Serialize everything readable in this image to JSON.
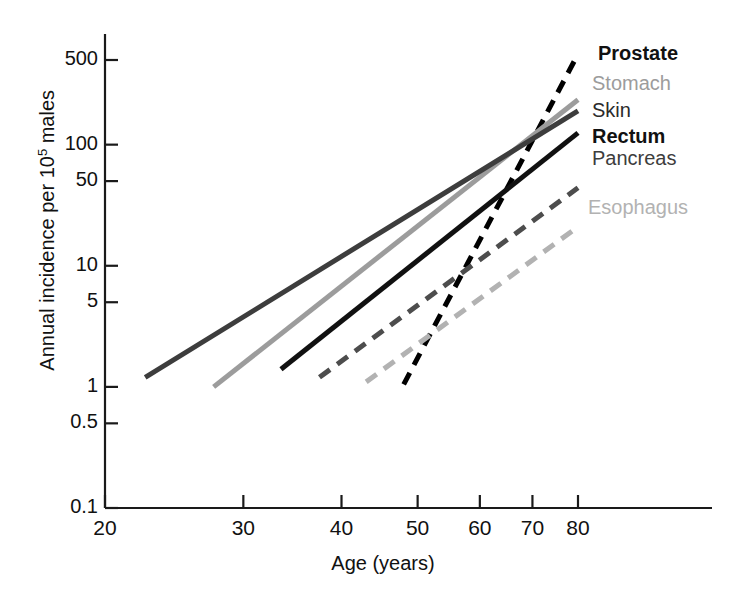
{
  "chart_data": {
    "type": "line",
    "title": "",
    "xlabel": "Age (years)",
    "ylabel": "Annual incidence per 10⁵ males",
    "ylabel_base": "Annual incidence per 10",
    "ylabel_exp": "5",
    "ylabel_tail": " males",
    "x_scale": "log",
    "y_scale": "log",
    "xlim": [
      20,
      90
    ],
    "ylim": [
      0.1,
      800
    ],
    "xticks": [
      20,
      30,
      40,
      50,
      60,
      70,
      80
    ],
    "xtick_labels": [
      "20",
      "30",
      "40",
      "50",
      "60",
      "70",
      "80"
    ],
    "yticks": [
      0.1,
      0.5,
      1,
      5,
      10,
      50,
      100,
      500
    ],
    "ytick_labels": [
      "0.1",
      "0.5",
      "1",
      "5",
      "10",
      "50",
      "100",
      "500"
    ],
    "grid": false,
    "legend_position": "right-inline-labels",
    "series": [
      {
        "name": "Prostate",
        "color": "#000000",
        "style": "dashed",
        "width": 5,
        "x": [
          48,
          80
        ],
        "y": [
          1.05,
          560
        ]
      },
      {
        "name": "Stomach",
        "color": "#9c9c9c",
        "style": "solid",
        "width": 5,
        "x": [
          27.5,
          80
        ],
        "y": [
          1.0,
          235
        ]
      },
      {
        "name": "Skin",
        "color": "#3d3d3d",
        "style": "solid",
        "width": 5,
        "x": [
          22.5,
          80
        ],
        "y": [
          1.2,
          190
        ]
      },
      {
        "name": "Rectum",
        "color": "#111111",
        "style": "solid",
        "width": 5,
        "x": [
          33.5,
          80
        ],
        "y": [
          1.4,
          125
        ]
      },
      {
        "name": "Pancreas",
        "color": "#4d4d4d",
        "style": "dashed",
        "width": 5,
        "x": [
          37.5,
          80
        ],
        "y": [
          1.2,
          44
        ]
      },
      {
        "name": "Esophagus",
        "color": "#b2b2b2",
        "style": "dashed",
        "width": 5,
        "x": [
          43,
          80
        ],
        "y": [
          1.1,
          21
        ]
      }
    ]
  },
  "legend": [
    {
      "label": "Prostate",
      "color": "#111111"
    },
    {
      "label": "Stomach",
      "color": "#9c9c9c"
    },
    {
      "label": "Skin",
      "color": "#2b2b2b"
    },
    {
      "label": "Rectum",
      "color": "#111111"
    },
    {
      "label": "Pancreas",
      "color": "#3d3d3d"
    },
    {
      "label": "Esophagus",
      "color": "#b2b2b2"
    }
  ]
}
